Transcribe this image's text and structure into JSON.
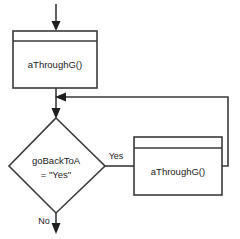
{
  "diagram": {
    "type": "flowchart",
    "background_color": "#ffffff",
    "stroke_color": "#3a3a3a",
    "text_color": "#1a1a1a",
    "nodes": [
      {
        "id": "process_top",
        "shape": "predefined-process",
        "label": "aThroughG()"
      },
      {
        "id": "decision",
        "shape": "diamond",
        "label_line1": "goBackToA",
        "label_line2": "= \"Yes\""
      },
      {
        "id": "process_right",
        "shape": "predefined-process",
        "label": "aThroughG()"
      }
    ],
    "edge_labels": {
      "yes": "Yes",
      "no": "No"
    }
  }
}
